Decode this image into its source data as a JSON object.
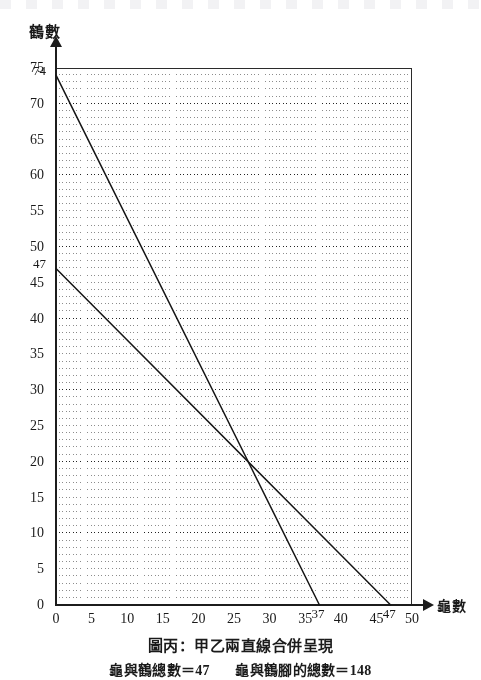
{
  "figure": {
    "caption_main": "圖丙：甲乙兩直線合併呈現",
    "caption_sub_left": "龜與鶴總數＝47",
    "caption_sub_right": "龜與鶴腳的總數＝148"
  },
  "axes": {
    "y_title": "鶴數",
    "x_title": "龜數"
  },
  "chart_data": {
    "type": "line",
    "title": "圖丙：甲乙兩直線合併呈現",
    "subtitle": "龜與鶴總數＝47　龜與鶴腳的總數＝148",
    "xlabel": "龜數",
    "ylabel": "鶴數",
    "xlim": [
      0,
      50
    ],
    "ylim": [
      0,
      75
    ],
    "xticks": [
      0,
      5,
      10,
      15,
      20,
      25,
      30,
      35,
      40,
      45,
      50
    ],
    "yticks": [
      0,
      5,
      10,
      15,
      20,
      25,
      30,
      35,
      40,
      45,
      50,
      55,
      60,
      65,
      70,
      75
    ],
    "xtick_labels": [
      "0",
      "5",
      "10",
      "15",
      "20",
      "25",
      "30",
      "35",
      "40",
      "45",
      "50"
    ],
    "ytick_labels": [
      "0",
      "5",
      "10",
      "15",
      "20",
      "25",
      "30",
      "35",
      "40",
      "45",
      "50",
      "55",
      "60",
      "65",
      "70",
      "75"
    ],
    "x_special_ticks": [
      {
        "value": 37,
        "label": "37"
      },
      {
        "value": 47,
        "label": "47"
      }
    ],
    "y_special_ticks": [
      {
        "value": 74,
        "label": "74"
      },
      {
        "value": 47,
        "label": "47"
      }
    ],
    "grid": "on",
    "grid_minor_step": 1,
    "grid_major_step": 10,
    "legend": "none",
    "series": [
      {
        "name": "甲",
        "equation": "2x + 4y = 148",
        "x": [
          0,
          37
        ],
        "values": [
          74,
          0
        ],
        "x_intercept": 37,
        "y_intercept": 74
      },
      {
        "name": "乙",
        "equation": "x + y = 47",
        "x": [
          0,
          47
        ],
        "values": [
          47,
          0
        ],
        "x_intercept": 47,
        "y_intercept": 47
      }
    ],
    "intersection": {
      "x": 27,
      "y": 20
    }
  }
}
